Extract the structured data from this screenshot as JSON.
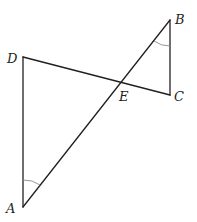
{
  "diagram": {
    "type": "geometry",
    "points": {
      "A": {
        "label": "A",
        "x": 23,
        "y": 207
      },
      "B": {
        "label": "B",
        "x": 170,
        "y": 20
      },
      "C": {
        "label": "C",
        "x": 170,
        "y": 95
      },
      "D": {
        "label": "D",
        "x": 23,
        "y": 57
      },
      "E": {
        "label": "E",
        "x": 122,
        "y": 82
      }
    },
    "segments": [
      "AD",
      "DC",
      "AB",
      "BC"
    ],
    "angle_marks": [
      {
        "vertex": "A",
        "between": [
          "D",
          "B"
        ]
      },
      {
        "vertex": "B",
        "between": [
          "A",
          "C"
        ]
      }
    ],
    "intersection": {
      "point": "E",
      "of": [
        "AB",
        "DC"
      ]
    }
  }
}
